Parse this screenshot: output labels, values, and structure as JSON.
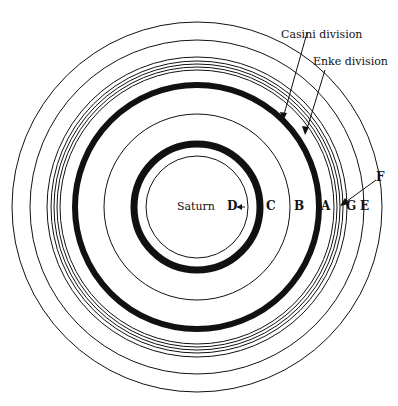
{
  "center": {
    "x": 197,
    "y": 207
  },
  "labels": {
    "saturn": "Saturn",
    "ring_d": "D",
    "ring_c": "C",
    "ring_b": "B",
    "ring_a": "A",
    "ring_g": "G",
    "ring_e": "E",
    "ring_f": "F",
    "casini": "Casini division",
    "enke": "Enke division"
  },
  "circles": [
    {
      "name": "saturn-body",
      "r": 51,
      "width": 1
    },
    {
      "name": "ring-d-inner-edge",
      "r": 63,
      "width": 7
    },
    {
      "name": "ring-c-b-boundary",
      "r": 93,
      "width": 1
    },
    {
      "name": "casini-division-ring",
      "r": 122,
      "width": 6
    },
    {
      "name": "ring-a-1",
      "r": 137,
      "width": 1
    },
    {
      "name": "ring-a-2",
      "r": 140,
      "width": 1
    },
    {
      "name": "ring-a-3",
      "r": 143,
      "width": 1
    },
    {
      "name": "ring-a-4",
      "r": 146,
      "width": 1
    },
    {
      "name": "ring-f",
      "r": 150,
      "width": 1
    },
    {
      "name": "ring-g",
      "r": 167,
      "width": 1
    },
    {
      "name": "ring-e-outer",
      "r": 185,
      "width": 1
    }
  ],
  "colors": {
    "ink": "#111111",
    "background": "#ffffff"
  }
}
